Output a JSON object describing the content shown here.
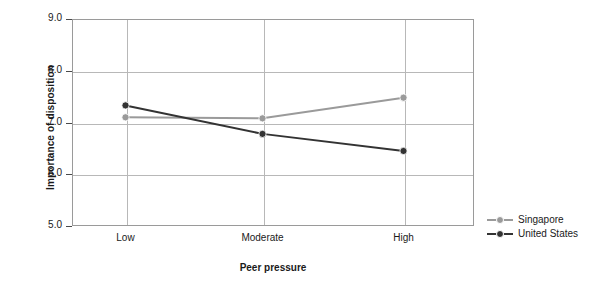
{
  "chart_data": {
    "type": "line",
    "title": "",
    "xlabel": "Peer pressure",
    "ylabel": "Importance of disposition",
    "categories": [
      "Low",
      "Moderate",
      "High"
    ],
    "ylim": [
      5.0,
      9.0
    ],
    "yticks": [
      "5.0",
      "6.0",
      "7.0",
      "8.0",
      "9.0"
    ],
    "ytick_values": [
      5.0,
      6.0,
      7.0,
      8.0,
      9.0
    ],
    "grid": "horizontal-and-vertical",
    "legend_position": "right",
    "series": [
      {
        "name": "Singapore",
        "color": "#9a9a9a",
        "values": [
          7.1,
          7.08,
          7.48
        ]
      },
      {
        "name": "United States",
        "color": "#333333",
        "values": [
          7.33,
          6.78,
          6.45
        ]
      }
    ]
  },
  "legend": {
    "items": [
      {
        "label": "Singapore"
      },
      {
        "label": "United States"
      }
    ]
  },
  "colors": {
    "singapore": "#9a9a9a",
    "united_states": "#333333",
    "grid": "#b8b8b8",
    "frame": "#9a9a9a",
    "background": "#ffffff",
    "text": "#1a1a1a"
  }
}
